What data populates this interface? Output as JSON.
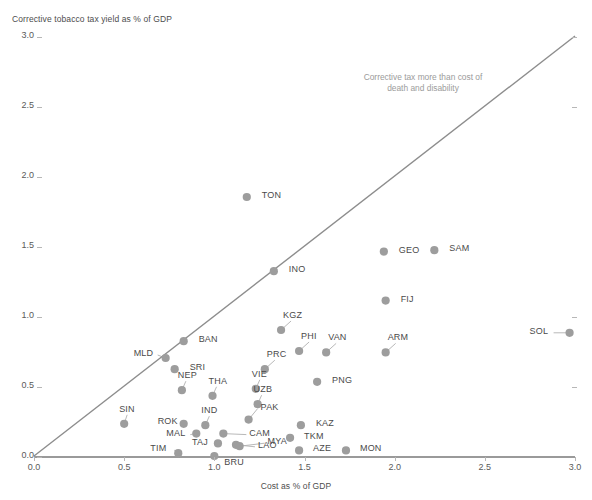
{
  "chart_data": {
    "type": "scatter",
    "title": "",
    "xlabel": "Cost as % of GDP",
    "ylabel": "Corrective tobacco tax yield as % of GDP",
    "xlim": [
      0.0,
      3.0
    ],
    "ylim": [
      0.0,
      3.0
    ],
    "xticks": [
      "0.0",
      "0.5",
      "1.0",
      "1.5",
      "2.0",
      "2.5",
      "3.0"
    ],
    "yticks": [
      "0.0",
      "0.5",
      "1.0",
      "1.5",
      "2.0",
      "2.5",
      "3.0"
    ],
    "grid": false,
    "legend": "none",
    "annotations": [
      {
        "name": "parity-region-note",
        "text": "Corrective tax more than cost of death and disability",
        "color": "#9b9b9b"
      }
    ],
    "reference_line": {
      "name": "parity-line",
      "description": "45-degree y = x line",
      "from": [
        0.0,
        0.0
      ],
      "to": [
        3.0,
        3.0
      ],
      "color": "#8d8d8d"
    },
    "marker_color": "#9d9d9d",
    "points": [
      {
        "label": "TON",
        "x": 1.18,
        "y": 1.85,
        "lx": 15,
        "ly": -5
      },
      {
        "label": "INO",
        "x": 1.33,
        "y": 1.32,
        "lx": 15,
        "ly": -5
      },
      {
        "label": "GEO",
        "x": 1.94,
        "y": 1.46,
        "lx": 15,
        "ly": -5
      },
      {
        "label": "SAM",
        "x": 2.22,
        "y": 1.47,
        "lx": 15,
        "ly": -5
      },
      {
        "label": "FIJ",
        "x": 1.95,
        "y": 1.11,
        "lx": 15,
        "ly": -5
      },
      {
        "label": "SOL",
        "x": 2.97,
        "y": 0.88,
        "lx": -40,
        "ly": -5
      },
      {
        "label": "KGZ",
        "x": 1.37,
        "y": 0.9,
        "lx": 2,
        "ly": -18
      },
      {
        "label": "BAN",
        "x": 0.83,
        "y": 0.82,
        "lx": 15,
        "ly": -5
      },
      {
        "label": "PHI",
        "x": 1.47,
        "y": 0.75,
        "lx": 2,
        "ly": -18
      },
      {
        "label": "VAN",
        "x": 1.62,
        "y": 0.74,
        "lx": 2,
        "ly": -18
      },
      {
        "label": "ARM",
        "x": 1.95,
        "y": 0.74,
        "lx": 2,
        "ly": -18
      },
      {
        "label": "MLD",
        "x": 0.73,
        "y": 0.7,
        "lx": -32,
        "ly": -8
      },
      {
        "label": "SRI",
        "x": 0.78,
        "y": 0.62,
        "lx": 15,
        "ly": -5
      },
      {
        "label": "PRC",
        "x": 1.28,
        "y": 0.62,
        "lx": 2,
        "ly": -18
      },
      {
        "label": "PNG",
        "x": 1.57,
        "y": 0.53,
        "lx": 15,
        "ly": -5
      },
      {
        "label": "NEP",
        "x": 0.82,
        "y": 0.47,
        "lx": -4,
        "ly": -18
      },
      {
        "label": "VIE",
        "x": 1.23,
        "y": 0.48,
        "lx": -4,
        "ly": -18
      },
      {
        "label": "THA",
        "x": 0.99,
        "y": 0.43,
        "lx": -4,
        "ly": -18
      },
      {
        "label": "UZB",
        "x": 1.24,
        "y": 0.37,
        "lx": -4,
        "ly": -18
      },
      {
        "label": "SIN",
        "x": 0.5,
        "y": 0.23,
        "lx": -5,
        "ly": -18
      },
      {
        "label": "ROK",
        "x": 0.83,
        "y": 0.23,
        "lx": -26,
        "ly": -6
      },
      {
        "label": "IND",
        "x": 0.95,
        "y": 0.22,
        "lx": -4,
        "ly": -18
      },
      {
        "label": "PAK",
        "x": 1.19,
        "y": 0.26,
        "lx": 12,
        "ly": -16
      },
      {
        "label": "KAZ",
        "x": 1.48,
        "y": 0.22,
        "lx": 15,
        "ly": -5
      },
      {
        "label": "CAM",
        "x": 1.05,
        "y": 0.16,
        "lx": 26,
        "ly": -4
      },
      {
        "label": "MAL",
        "x": 0.9,
        "y": 0.16,
        "lx": -30,
        "ly": -4
      },
      {
        "label": "TKM",
        "x": 1.42,
        "y": 0.13,
        "lx": 14,
        "ly": -5
      },
      {
        "label": "TAJ",
        "x": 1.02,
        "y": 0.09,
        "lx": -26,
        "ly": -4
      },
      {
        "label": "LAO",
        "x": 1.12,
        "y": 0.08,
        "lx": 22,
        "ly": -3
      },
      {
        "label": "MYA",
        "x": 1.14,
        "y": 0.07,
        "lx": 28,
        "ly": -8
      },
      {
        "label": "AZE",
        "x": 1.47,
        "y": 0.04,
        "lx": 14,
        "ly": -5
      },
      {
        "label": "MON",
        "x": 1.73,
        "y": 0.04,
        "lx": 14,
        "ly": -5
      },
      {
        "label": "TIM",
        "x": 0.8,
        "y": 0.02,
        "lx": -28,
        "ly": -8
      },
      {
        "label": "BRU",
        "x": 1.0,
        "y": 0.0,
        "lx": 10,
        "ly": 3
      }
    ]
  }
}
